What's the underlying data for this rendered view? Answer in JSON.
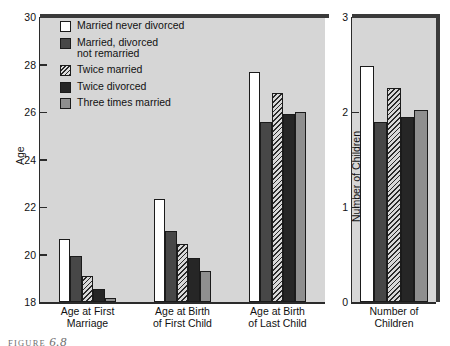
{
  "figure": {
    "caption_prefix": "FIGURE",
    "caption_number": "6.8"
  },
  "legend": {
    "items": [
      {
        "label": "Married never divorced",
        "fill": "white"
      },
      {
        "label": "Married, divorced\nnot remarried",
        "fill": "dark"
      },
      {
        "label": "Twice married",
        "fill": "hatch"
      },
      {
        "label": "Twice divorced",
        "fill": "black"
      },
      {
        "label": "Three times married",
        "fill": "gray"
      }
    ]
  },
  "chart_data": [
    {
      "type": "bar",
      "id": "age-chart",
      "title": "",
      "xlabel": "",
      "ylabel": "Age",
      "ylim": [
        18,
        30
      ],
      "yticks": [
        18,
        20,
        22,
        24,
        26,
        28,
        30
      ],
      "grid": false,
      "legend_position": "upper-left-inside",
      "categories": [
        "Age at First\nMarriage",
        "Age at Birth\nof First Child",
        "Age at Birth\nof Last Child"
      ],
      "series": [
        {
          "name": "Married never divorced",
          "fill": "white",
          "values": [
            20.65,
            22.35,
            27.7
          ]
        },
        {
          "name": "Married, divorced not remarried",
          "fill": "dark",
          "values": [
            19.95,
            21.0,
            25.6
          ]
        },
        {
          "name": "Twice married",
          "fill": "hatch",
          "values": [
            19.1,
            20.45,
            26.8
          ]
        },
        {
          "name": "Twice divorced",
          "fill": "black",
          "values": [
            18.55,
            19.85,
            25.9
          ]
        },
        {
          "name": "Three times married",
          "fill": "gray",
          "values": [
            18.15,
            19.3,
            26.0
          ]
        }
      ]
    },
    {
      "type": "bar",
      "id": "children-chart",
      "title": "",
      "xlabel": "",
      "ylabel": "Number of Children",
      "ylim": [
        0,
        3
      ],
      "yticks": [
        0,
        1,
        2,
        3
      ],
      "grid": false,
      "legend_position": "none",
      "categories": [
        "Number of\nChildren"
      ],
      "series": [
        {
          "name": "Married never divorced",
          "fill": "white",
          "values": [
            2.48
          ]
        },
        {
          "name": "Married, divorced not remarried",
          "fill": "dark",
          "values": [
            1.89
          ]
        },
        {
          "name": "Twice married",
          "fill": "hatch",
          "values": [
            2.25
          ]
        },
        {
          "name": "Twice divorced",
          "fill": "black",
          "values": [
            1.95
          ]
        },
        {
          "name": "Three times married",
          "fill": "gray",
          "values": [
            2.02
          ]
        }
      ]
    }
  ]
}
